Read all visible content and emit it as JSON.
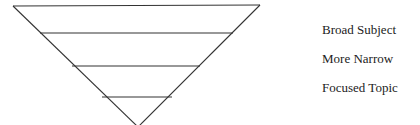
{
  "diagram": {
    "type": "inverted-pyramid",
    "levels": 4,
    "line_color": "#333333",
    "labels": [
      {
        "text": "Broad Subject",
        "top": 23
      },
      {
        "text": "More Narrow",
        "top": 52
      },
      {
        "text": "Focused Topic",
        "top": 81
      }
    ]
  }
}
